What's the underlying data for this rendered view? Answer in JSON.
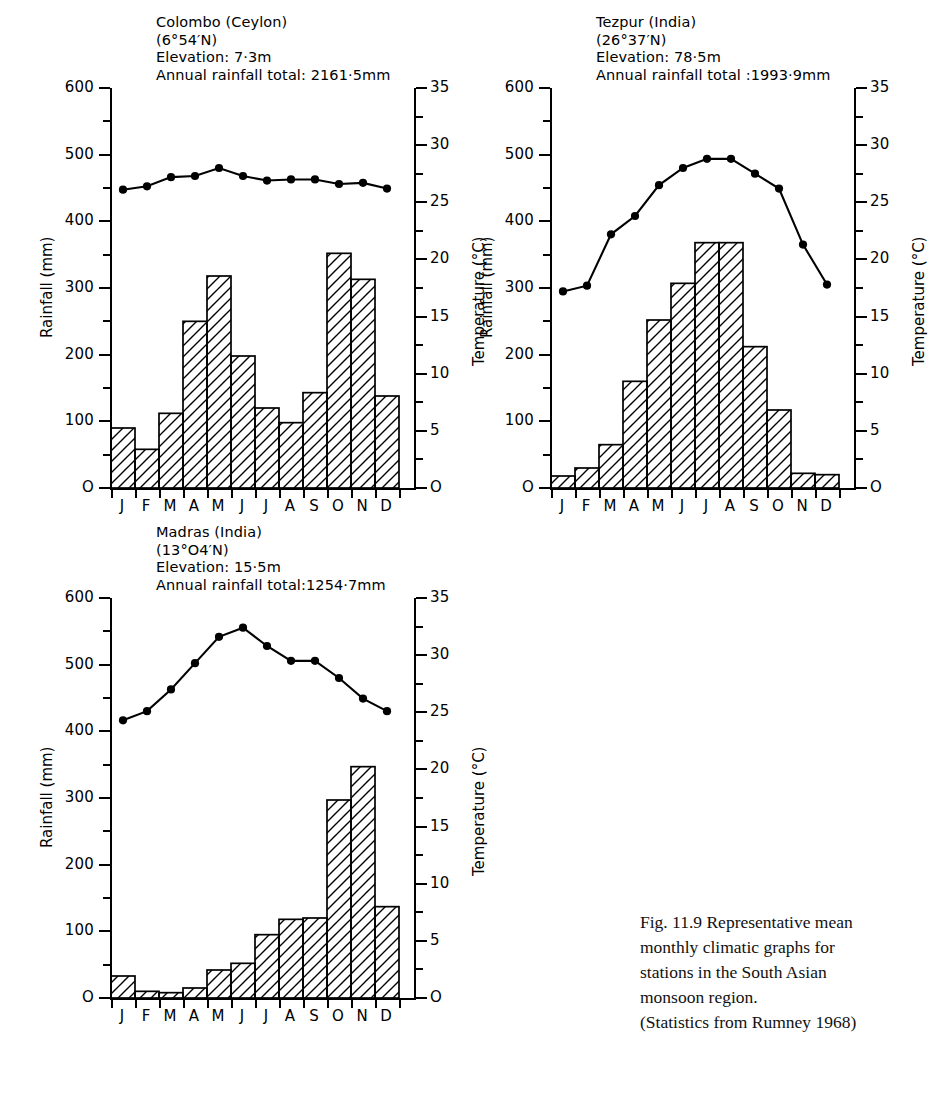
{
  "figure": {
    "ghost_header": "",
    "caption_line1": "Fig. 11.9   Representative mean",
    "caption_line2": "monthly climatic graphs for",
    "caption_line3": "stations in the South Asian",
    "caption_line4": "monsoon region.",
    "caption_line5": "(Statistics from Rumney 1968)"
  },
  "axes": {
    "left_title": "Rainfall (mm)",
    "right_title": "Temperature (°C)",
    "left_ticks": [
      "600",
      "500",
      "400",
      "300",
      "200",
      "100",
      "O"
    ],
    "left_values": [
      600,
      500,
      400,
      300,
      200,
      100,
      0
    ],
    "right_ticks": [
      "35",
      "30",
      "25",
      "20",
      "15",
      "10",
      "5",
      "O"
    ],
    "right_values": [
      35,
      30,
      25,
      20,
      15,
      10,
      5,
      0
    ],
    "months": [
      "J",
      "F",
      "M",
      "A",
      "M",
      "J",
      "J",
      "A",
      "S",
      "O",
      "N",
      "D"
    ],
    "rain_min": 0,
    "rain_max": 600,
    "temp_min": 0,
    "temp_max": 35
  },
  "chart_data": [
    {
      "type": "bar",
      "id": "colombo",
      "title": "Colombo (Ceylon)",
      "coordinates": "(6°54′N)",
      "elevation": "Elevation: 7·3m",
      "annual": "Annual rainfall total: 2161·5mm",
      "xlabel": "",
      "ylabel": "Rainfall (mm)",
      "y2label": "Temperature (°C)",
      "ylim": [
        0,
        600
      ],
      "y2lim": [
        0,
        35
      ],
      "grid": false,
      "categories": [
        "J",
        "F",
        "M",
        "A",
        "M",
        "J",
        "J",
        "A",
        "S",
        "O",
        "N",
        "D"
      ],
      "series": [
        {
          "name": "Rainfall",
          "type": "bar",
          "unit": "mm",
          "values": [
            90,
            58,
            112,
            250,
            318,
            198,
            120,
            98,
            143,
            352,
            313,
            138
          ]
        },
        {
          "name": "Temperature",
          "type": "line",
          "unit": "°C",
          "values": [
            26.1,
            26.4,
            27.2,
            27.3,
            28.0,
            27.3,
            26.9,
            27.0,
            27.0,
            26.6,
            26.7,
            26.2
          ]
        }
      ]
    },
    {
      "type": "bar",
      "id": "tezpur",
      "title": "Tezpur  (India)",
      "coordinates": "(26°37′N)",
      "elevation": "Elevation: 78·5m",
      "annual": "Annual rainfall total :1993·9mm",
      "xlabel": "",
      "ylabel": "Rainfall (mm)",
      "y2label": "Temperature (°C)",
      "ylim": [
        0,
        600
      ],
      "y2lim": [
        0,
        35
      ],
      "grid": false,
      "categories": [
        "J",
        "F",
        "M",
        "A",
        "M",
        "J",
        "J",
        "A",
        "S",
        "O",
        "N",
        "D"
      ],
      "series": [
        {
          "name": "Rainfall",
          "type": "bar",
          "unit": "mm",
          "values": [
            18,
            30,
            65,
            160,
            252,
            307,
            368,
            368,
            212,
            117,
            22,
            20
          ]
        },
        {
          "name": "Temperature",
          "type": "line",
          "unit": "°C",
          "values": [
            17.2,
            17.7,
            22.2,
            23.8,
            26.5,
            28.0,
            28.8,
            28.8,
            27.5,
            26.2,
            21.3,
            17.8
          ]
        }
      ]
    },
    {
      "type": "bar",
      "id": "madras",
      "title": "Madras (India)",
      "coordinates": "(13°O4′N)",
      "elevation": "Elevation: 15·5m",
      "annual": "Annual rainfall total:1254·7mm",
      "xlabel": "",
      "ylabel": "Rainfall (mm)",
      "y2label": "Temperature (°C)",
      "ylim": [
        0,
        600
      ],
      "y2lim": [
        0,
        35
      ],
      "grid": false,
      "categories": [
        "J",
        "F",
        "M",
        "A",
        "M",
        "J",
        "J",
        "A",
        "S",
        "O",
        "N",
        "D"
      ],
      "series": [
        {
          "name": "Rainfall",
          "type": "bar",
          "unit": "mm",
          "values": [
            33,
            10,
            8,
            15,
            42,
            52,
            95,
            118,
            120,
            297,
            347,
            137
          ]
        },
        {
          "name": "Temperature",
          "type": "line",
          "unit": "°C",
          "values": [
            24.3,
            25.1,
            27.0,
            29.3,
            31.6,
            32.4,
            30.8,
            29.5,
            29.5,
            28.0,
            26.2,
            25.1
          ]
        }
      ]
    }
  ]
}
